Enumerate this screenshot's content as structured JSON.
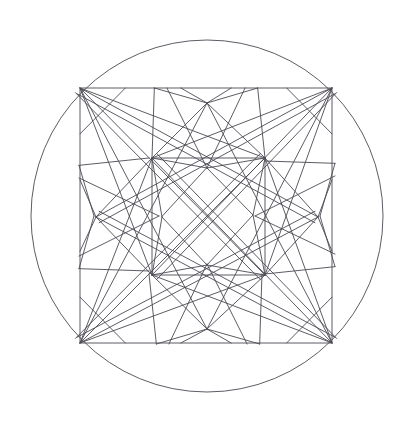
{
  "figure": {
    "title": "Geometric star construction in circle and square",
    "background_color": "#ffffff",
    "stroke_color": "#4a4a52",
    "stroke_width": 0.9,
    "canvas": {
      "width": 410,
      "height": 431
    }
  },
  "chart_data": {
    "type": "diagram",
    "title": "Geometric star construction in circle and square",
    "symmetry": "4-fold dihedral (D4)",
    "center": {
      "x": 207,
      "y": 216
    },
    "circle": {
      "name": "circumscribing-circle",
      "cx": 207,
      "cy": 216,
      "r": 176
    },
    "square": {
      "name": "inscribed-square",
      "x": 80,
      "y": 88,
      "width": 252,
      "height": 255,
      "corners": [
        {
          "x": 80,
          "y": 88
        },
        {
          "x": 332,
          "y": 88
        },
        {
          "x": 332,
          "y": 343
        },
        {
          "x": 80,
          "y": 343
        }
      ]
    },
    "central_diamond": {
      "name": "central-rotated-square",
      "vertices": [
        {
          "x": 207,
          "y": 168
        },
        {
          "x": 253,
          "y": 215
        },
        {
          "x": 207,
          "y": 265
        },
        {
          "x": 162,
          "y": 217
        }
      ]
    },
    "hubs": [
      {
        "name": "hub-top-left",
        "x": 152,
        "y": 158
      },
      {
        "name": "hub-top-right",
        "x": 265,
        "y": 158
      },
      {
        "name": "hub-bottom-right",
        "x": 265,
        "y": 275
      },
      {
        "name": "hub-bottom-left",
        "x": 152,
        "y": 275
      }
    ],
    "edge_nodes": [
      {
        "name": "edge-node-top",
        "x": 207,
        "y": 103
      },
      {
        "name": "edge-node-left",
        "x": 96,
        "y": 217
      },
      {
        "name": "edge-node-right",
        "x": 318,
        "y": 217
      },
      {
        "name": "edge-node-bottom",
        "x": 207,
        "y": 329
      }
    ],
    "grid": false,
    "legend": false,
    "axes": false
  }
}
